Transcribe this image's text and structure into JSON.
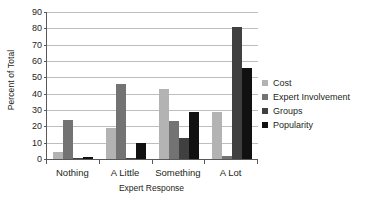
{
  "chart_data": {
    "type": "bar",
    "title": "",
    "subtitle": "",
    "xlabel": "Expert Response",
    "ylabel": "Percent of Total",
    "categories": [
      "Nothing",
      "A Little",
      "Something",
      "A Lot"
    ],
    "series": [
      {
        "name": "Cost",
        "color": "#b3b3b3",
        "values": [
          4,
          19,
          43,
          29
        ]
      },
      {
        "name": "Expert Involvement",
        "color": "#737373",
        "values": [
          24,
          46,
          23,
          2
        ]
      },
      {
        "name": "Groups",
        "color": "#404040",
        "values": [
          0.5,
          0.5,
          13,
          81
        ]
      },
      {
        "name": "Popularity",
        "color": "#111111",
        "values": [
          1.5,
          10,
          29,
          56
        ]
      }
    ],
    "ylim": [
      0,
      90
    ],
    "yticks": [
      0,
      10,
      20,
      30,
      40,
      50,
      60,
      70,
      80,
      90
    ],
    "ytick_labels": [
      "0",
      "10",
      "20",
      "30",
      "40",
      "50",
      "60",
      "70",
      "80",
      "90"
    ],
    "grid": true,
    "grid_axis": "y",
    "legend_position": "right",
    "axis_color": "#58595b",
    "grid_color": "#bcbec0",
    "background": "#ffffff"
  }
}
